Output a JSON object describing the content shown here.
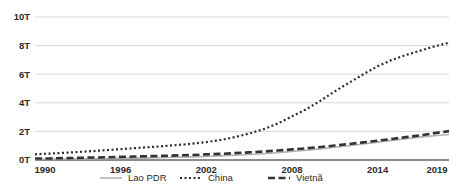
{
  "chart_data": {
    "type": "line",
    "title": "",
    "xlabel": "",
    "ylabel": "",
    "xlim": [
      1990,
      2019
    ],
    "ylim": [
      0,
      10
    ],
    "grid": true,
    "legend_position": "bottom",
    "y_tick_labels": [
      "0T",
      "2T",
      "4T",
      "6T",
      "8T",
      "10T"
    ],
    "y_tick_values": [
      0,
      2,
      4,
      6,
      8,
      10
    ],
    "x_tick_labels": [
      "1990",
      "1996",
      "2002",
      "2008",
      "2014",
      "2019"
    ],
    "x_tick_values": [
      1990,
      1996,
      2002,
      2008,
      2014,
      2019
    ],
    "x": [
      1990,
      1991,
      1992,
      1993,
      1994,
      1995,
      1996,
      1997,
      1998,
      1999,
      2000,
      2001,
      2002,
      2003,
      2004,
      2005,
      2006,
      2007,
      2008,
      2009,
      2010,
      2011,
      2012,
      2013,
      2014,
      2015,
      2016,
      2017,
      2018,
      2019
    ],
    "series": [
      {
        "name": "Lao PDR",
        "style": "solid",
        "color": "#b3b3b3",
        "values": [
          0.05,
          0.06,
          0.07,
          0.08,
          0.09,
          0.11,
          0.12,
          0.13,
          0.15,
          0.17,
          0.19,
          0.22,
          0.25,
          0.29,
          0.33,
          0.38,
          0.44,
          0.51,
          0.6,
          0.68,
          0.78,
          0.89,
          1.0,
          1.12,
          1.25,
          1.37,
          1.49,
          1.6,
          1.7,
          1.78
        ]
      },
      {
        "name": "China",
        "style": "dotted",
        "color": "#2b2b2b",
        "values": [
          0.4,
          0.45,
          0.5,
          0.56,
          0.62,
          0.69,
          0.76,
          0.83,
          0.9,
          0.97,
          1.05,
          1.14,
          1.25,
          1.4,
          1.6,
          1.85,
          2.15,
          2.55,
          3.05,
          3.55,
          4.15,
          4.8,
          5.4,
          6.0,
          6.55,
          7.0,
          7.35,
          7.65,
          7.95,
          8.2
        ]
      },
      {
        "name": "Vietnã",
        "style": "dashed",
        "color": "#333333",
        "values": [
          0.1,
          0.11,
          0.13,
          0.15,
          0.17,
          0.19,
          0.22,
          0.24,
          0.27,
          0.29,
          0.32,
          0.35,
          0.39,
          0.43,
          0.48,
          0.53,
          0.59,
          0.66,
          0.74,
          0.82,
          0.91,
          1.01,
          1.12,
          1.23,
          1.35,
          1.47,
          1.6,
          1.73,
          1.88,
          2.02
        ]
      }
    ]
  },
  "legend": {
    "items": [
      {
        "label": "Lao PDR"
      },
      {
        "label": "China"
      },
      {
        "label": "Vietnã"
      }
    ]
  },
  "colors": {
    "background": "#ffffff",
    "grid": "#c9c9c9",
    "axis": "#8d8d8d",
    "text": "#2b2b2b"
  }
}
